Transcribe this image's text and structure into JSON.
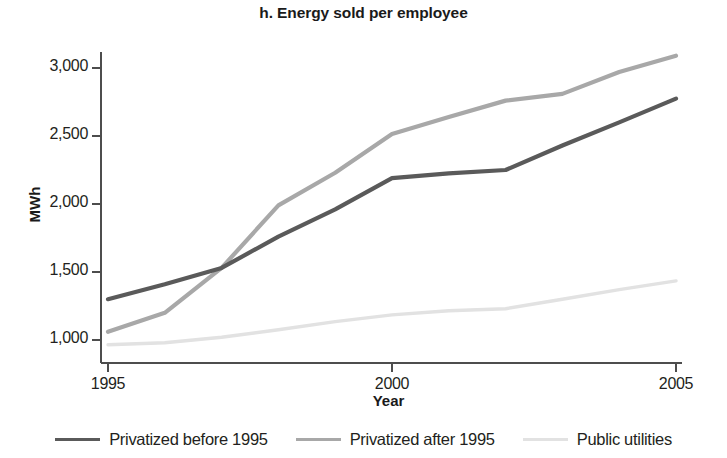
{
  "chart_data": {
    "type": "line",
    "title": "h. Energy sold per employee",
    "xlabel": "Year",
    "ylabel": "MWh",
    "xlim": [
      1995,
      2005
    ],
    "ylim": [
      850,
      3150
    ],
    "grid": false,
    "legend_position": "bottom",
    "xticks": [
      "1995",
      "2000",
      "2005"
    ],
    "xtick_values": [
      1995,
      2000,
      2005
    ],
    "yticks": [
      "1,000",
      "1,500",
      "2,000",
      "2,500",
      "3,000"
    ],
    "ytick_values": [
      1000,
      1500,
      2000,
      2500,
      3000
    ],
    "x": [
      1995,
      1996,
      1997,
      1998,
      1999,
      2000,
      2001,
      2002,
      2003,
      2004,
      2005
    ],
    "series": [
      {
        "name": "Privatized before 1995",
        "color": "#5a5a5a",
        "width": 4.2,
        "values": [
          1300,
          1410,
          1530,
          1760,
          1960,
          2190,
          2225,
          2250,
          2430,
          2600,
          2775
        ]
      },
      {
        "name": "Privatized after 1995",
        "color": "#a8a8a8",
        "width": 4.2,
        "values": [
          1060,
          1200,
          1530,
          1990,
          2230,
          2515,
          2640,
          2760,
          2810,
          2970,
          3090
        ]
      },
      {
        "name": "Public utilities",
        "color": "#e2e2e2",
        "width": 3.4,
        "values": [
          965,
          980,
          1020,
          1075,
          1135,
          1185,
          1215,
          1230,
          1300,
          1370,
          1435
        ]
      }
    ]
  },
  "axes": {
    "axis_color": "#4d4d4d"
  }
}
